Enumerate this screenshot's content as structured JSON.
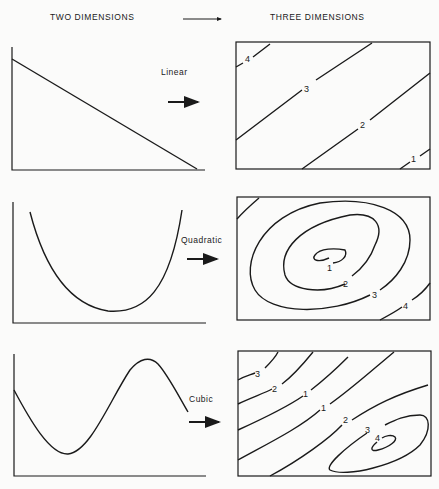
{
  "header": {
    "left_title": "TWO DIMENSIONS",
    "right_title": "THREE DIMENSIONS",
    "arrow_icon": "long-right-arrow"
  },
  "rows": [
    {
      "label": "Linear",
      "curve_type": "linear",
      "contour_labels": [
        "4",
        "3",
        "2",
        "1"
      ]
    },
    {
      "label": "Quadratic",
      "curve_type": "quadratic",
      "contour_labels": [
        "1",
        "2",
        "3",
        "4"
      ]
    },
    {
      "label": "Cubic",
      "curve_type": "cubic",
      "contour_labels": [
        "3",
        "2",
        "1",
        "1",
        "2",
        "3",
        "4"
      ]
    }
  ]
}
